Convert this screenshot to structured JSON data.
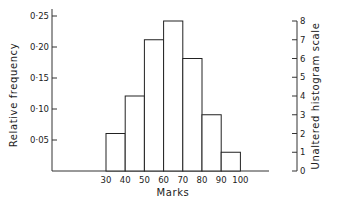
{
  "chart_data": {
    "type": "bar",
    "title": "",
    "xlabel": "Marks",
    "ylabel": "Relative frequency",
    "y2label": "Unaltered histogram scale",
    "bins": [
      [
        30,
        40
      ],
      [
        40,
        50
      ],
      [
        50,
        60
      ],
      [
        60,
        70
      ],
      [
        70,
        80
      ],
      [
        80,
        90
      ],
      [
        90,
        100
      ]
    ],
    "x_ticks": [
      "30",
      "40",
      "50",
      "60",
      "70",
      "80",
      "90",
      "100"
    ],
    "counts": [
      2,
      4,
      7,
      8,
      6,
      3,
      1
    ],
    "relative_frequency": [
      0.065,
      0.129,
      0.226,
      0.258,
      0.194,
      0.097,
      0.032
    ],
    "ylim": [
      0,
      0.27
    ],
    "y_ticks": [
      "0·05",
      "0·10",
      "0·15",
      "0·20",
      "0·25"
    ],
    "y_tick_values": [
      0.05,
      0.1,
      0.15,
      0.2,
      0.25
    ],
    "y2lim": [
      0,
      8
    ],
    "y2_ticks": [
      "0",
      "1",
      "2",
      "3",
      "4",
      "5",
      "6",
      "7",
      "8"
    ],
    "grid": false,
    "legend": "none"
  }
}
